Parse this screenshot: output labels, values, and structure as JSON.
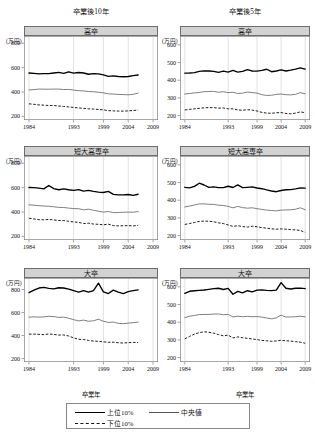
{
  "figure": {
    "unit_label": "(万円)",
    "xlabel": "卒業年",
    "columns": [
      {
        "key": "y10",
        "title": "卒業後10年"
      },
      {
        "key": "y5",
        "title": "卒業後5年"
      }
    ],
    "legend": {
      "items": [
        {
          "name": "top10",
          "label": "上位10%",
          "style": "thick-solid"
        },
        {
          "name": "median",
          "label": "中央値",
          "style": "thin-solid"
        },
        {
          "name": "bottom10",
          "label": "下位10%",
          "style": "dashed"
        }
      ]
    }
  },
  "chart_data": [
    {
      "id": "hs-10y",
      "type": "line",
      "title": "高卒",
      "column": "卒業後10年",
      "xlabel": "卒業年",
      "ylabel": "(万円)",
      "xlim": [
        1983,
        2010
      ],
      "ylim": [
        170,
        860
      ],
      "xticks": [
        1984,
        1993,
        1999,
        2004,
        2009
      ],
      "yticks": [
        200,
        400,
        600,
        800
      ],
      "grid": true,
      "x": [
        1984,
        1985,
        1986,
        1987,
        1988,
        1989,
        1990,
        1991,
        1992,
        1993,
        1994,
        1995,
        1996,
        1997,
        1998,
        1999,
        2000,
        2001,
        2002,
        2003,
        2004,
        2005,
        2006
      ],
      "series": [
        {
          "name": "上位10%",
          "values": [
            556,
            553,
            549,
            551,
            551,
            556,
            561,
            553,
            566,
            555,
            560,
            556,
            546,
            551,
            549,
            540,
            528,
            532,
            527,
            525,
            527,
            534,
            540
          ]
        },
        {
          "name": "中央値",
          "values": [
            417,
            420,
            424,
            423,
            423,
            424,
            424,
            420,
            421,
            416,
            411,
            409,
            404,
            402,
            398,
            393,
            385,
            383,
            380,
            379,
            377,
            381,
            391
          ]
        },
        {
          "name": "下位10%",
          "values": [
            303,
            299,
            294,
            292,
            289,
            289,
            285,
            281,
            278,
            273,
            269,
            266,
            262,
            260,
            257,
            253,
            247,
            245,
            243,
            243,
            245,
            248,
            252
          ]
        }
      ]
    },
    {
      "id": "hs-5y",
      "type": "line",
      "title": "高卒",
      "column": "卒業後5年",
      "xlabel": "卒業年",
      "ylabel": "(万円)",
      "xlim": [
        1983,
        2010
      ],
      "ylim": [
        175,
        650
      ],
      "xticks": [
        1984,
        1993,
        1999,
        2004,
        2009
      ],
      "yticks": [
        200,
        300,
        400,
        500,
        600
      ],
      "grid": true,
      "x": [
        1984,
        1985,
        1986,
        1987,
        1988,
        1989,
        1990,
        1991,
        1992,
        1993,
        1994,
        1995,
        1996,
        1997,
        1998,
        1999,
        2000,
        2001,
        2002,
        2003,
        2004,
        2005,
        2006,
        2007,
        2008,
        2009
      ],
      "series": [
        {
          "name": "上位10%",
          "values": [
            440,
            441,
            443,
            450,
            453,
            452,
            450,
            444,
            451,
            446,
            455,
            446,
            450,
            460,
            452,
            451,
            456,
            462,
            448,
            452,
            459,
            452,
            457,
            463,
            470,
            463
          ]
        },
        {
          "name": "中央値",
          "values": [
            322,
            325,
            328,
            331,
            335,
            336,
            337,
            332,
            335,
            330,
            332,
            325,
            327,
            333,
            330,
            327,
            318,
            314,
            315,
            320,
            322,
            318,
            317,
            320,
            330,
            323
          ]
        },
        {
          "name": "下位10%",
          "values": [
            232,
            235,
            238,
            241,
            244,
            245,
            245,
            242,
            243,
            238,
            238,
            232,
            230,
            233,
            231,
            226,
            218,
            214,
            213,
            216,
            217,
            212,
            210,
            214,
            221,
            216
          ]
        }
      ]
    },
    {
      "id": "jc-10y",
      "type": "line",
      "title": "短大高専卒",
      "column": "卒業後10年",
      "xlabel": "卒業年",
      "ylabel": "(万円)",
      "xlim": [
        1983,
        2010
      ],
      "ylim": [
        170,
        860
      ],
      "xticks": [
        1984,
        1993,
        1999,
        2004,
        2009
      ],
      "yticks": [
        200,
        400,
        600,
        800
      ],
      "grid": true,
      "x": [
        1984,
        1985,
        1986,
        1987,
        1988,
        1989,
        1990,
        1991,
        1992,
        1993,
        1994,
        1995,
        1996,
        1997,
        1998,
        1999,
        2000,
        2001,
        2002,
        2003,
        2004,
        2005,
        2006
      ],
      "series": [
        {
          "name": "上位10%",
          "values": [
            601,
            600,
            596,
            590,
            618,
            592,
            583,
            590,
            583,
            578,
            584,
            571,
            577,
            569,
            563,
            560,
            569,
            545,
            541,
            541,
            544,
            537,
            546
          ]
        },
        {
          "name": "中央値",
          "values": [
            459,
            456,
            452,
            449,
            447,
            443,
            438,
            437,
            432,
            428,
            427,
            418,
            423,
            414,
            407,
            399,
            404,
            395,
            396,
            398,
            399,
            398,
            404
          ]
        },
        {
          "name": "下位10%",
          "values": [
            349,
            343,
            337,
            336,
            339,
            335,
            330,
            330,
            324,
            318,
            315,
            305,
            308,
            301,
            299,
            295,
            300,
            288,
            286,
            287,
            288,
            286,
            290
          ]
        }
      ]
    },
    {
      "id": "jc-5y",
      "type": "line",
      "title": "短大高専卒",
      "column": "卒業後5年",
      "xlabel": "卒業年",
      "ylabel": "(万円)",
      "xlim": [
        1983,
        2010
      ],
      "ylim": [
        175,
        650
      ],
      "xticks": [
        1984,
        1993,
        1999,
        2004,
        2009
      ],
      "yticks": [
        200,
        300,
        400,
        500,
        600
      ],
      "grid": true,
      "x": [
        1984,
        1985,
        1986,
        1987,
        1988,
        1989,
        1990,
        1991,
        1992,
        1993,
        1994,
        1995,
        1996,
        1997,
        1998,
        1999,
        2000,
        2001,
        2002,
        2003,
        2004,
        2005,
        2006,
        2007,
        2008,
        2009
      ],
      "series": [
        {
          "name": "上位10%",
          "values": [
            473,
            470,
            478,
            496,
            486,
            473,
            475,
            471,
            471,
            479,
            472,
            487,
            471,
            473,
            475,
            469,
            465,
            458,
            452,
            448,
            455,
            459,
            460,
            464,
            470,
            468
          ]
        },
        {
          "name": "中央値",
          "values": [
            362,
            367,
            373,
            379,
            379,
            377,
            376,
            372,
            370,
            365,
            357,
            365,
            358,
            355,
            357,
            352,
            348,
            344,
            342,
            340,
            344,
            345,
            346,
            349,
            357,
            346
          ]
        },
        {
          "name": "下位10%",
          "values": [
            263,
            268,
            274,
            280,
            282,
            281,
            278,
            272,
            268,
            260,
            252,
            256,
            251,
            248,
            253,
            250,
            245,
            242,
            238,
            236,
            238,
            236,
            234,
            232,
            229,
            218
          ]
        }
      ]
    },
    {
      "id": "univ-10y",
      "type": "line",
      "title": "大卒",
      "column": "卒業後10年",
      "xlabel": "卒業年",
      "ylabel": "(万円)",
      "xlim": [
        1983,
        2010
      ],
      "ylim": [
        170,
        900
      ],
      "xticks": [
        1984,
        1993,
        1999,
        2004,
        2009
      ],
      "yticks": [
        200,
        400,
        600,
        800
      ],
      "grid": true,
      "x": [
        1984,
        1985,
        1986,
        1987,
        1988,
        1989,
        1990,
        1991,
        1992,
        1993,
        1994,
        1995,
        1996,
        1997,
        1998,
        1999,
        2000,
        2001,
        2002,
        2003,
        2004,
        2005,
        2006
      ],
      "series": [
        {
          "name": "上位10%",
          "values": [
            773,
            795,
            813,
            818,
            810,
            805,
            815,
            813,
            804,
            790,
            777,
            790,
            777,
            790,
            855,
            780,
            765,
            795,
            778,
            765,
            782,
            790,
            797
          ]
        },
        {
          "name": "中央値",
          "values": [
            559,
            562,
            560,
            562,
            567,
            565,
            558,
            560,
            550,
            538,
            527,
            534,
            524,
            528,
            542,
            524,
            514,
            517,
            506,
            503,
            508,
            512,
            517
          ]
        },
        {
          "name": "下位10%",
          "values": [
            412,
            412,
            410,
            408,
            413,
            410,
            404,
            405,
            396,
            380,
            367,
            366,
            357,
            352,
            350,
            345,
            341,
            342,
            337,
            335,
            338,
            340,
            339
          ]
        }
      ]
    },
    {
      "id": "univ-5y",
      "type": "line",
      "title": "大卒",
      "column": "卒業後5年",
      "xlabel": "卒業年",
      "ylabel": "(万円)",
      "xlim": [
        1983,
        2010
      ],
      "ylim": [
        175,
        650
      ],
      "xticks": [
        1984,
        1993,
        1999,
        2004,
        2009
      ],
      "yticks": [
        200,
        300,
        400,
        500,
        600
      ],
      "grid": true,
      "x": [
        1984,
        1985,
        1986,
        1987,
        1988,
        1989,
        1990,
        1991,
        1992,
        1993,
        1994,
        1995,
        1996,
        1997,
        1998,
        1999,
        2000,
        2001,
        2002,
        2003,
        2004,
        2005,
        2006,
        2007,
        2008,
        2009
      ],
      "series": [
        {
          "name": "上位10%",
          "values": [
            563,
            575,
            578,
            580,
            582,
            586,
            590,
            592,
            585,
            591,
            558,
            574,
            566,
            578,
            572,
            581,
            583,
            580,
            579,
            581,
            624,
            592,
            588,
            592,
            593,
            590
          ]
        },
        {
          "name": "中央値",
          "values": [
            426,
            434,
            438,
            443,
            444,
            444,
            446,
            447,
            442,
            444,
            430,
            434,
            431,
            433,
            431,
            432,
            429,
            424,
            419,
            425,
            440,
            429,
            430,
            431,
            434,
            430
          ]
        },
        {
          "name": "下位10%",
          "values": [
            306,
            320,
            333,
            341,
            346,
            343,
            338,
            330,
            323,
            327,
            311,
            317,
            312,
            309,
            305,
            302,
            297,
            295,
            292,
            294,
            298,
            295,
            293,
            290,
            287,
            281
          ]
        }
      ]
    }
  ]
}
